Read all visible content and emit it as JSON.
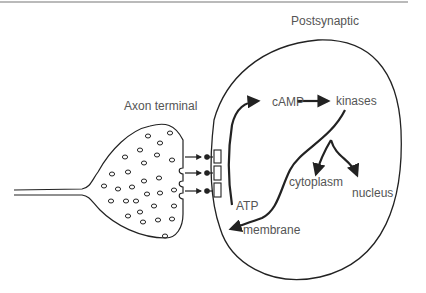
{
  "figure": {
    "top_rule": true,
    "colors": {
      "stroke": "#222222",
      "text": "#555555",
      "background": "#ffffff"
    },
    "labels": {
      "postsynaptic": "Postsynaptic",
      "axon_terminal": "Axon terminal",
      "camp": "cAMP",
      "kinases": "kinases",
      "cytoplasm": "cytoplasm",
      "nucleus": "nucleus",
      "atp": "ATP",
      "membrane": "membrane"
    },
    "pathway": [
      {
        "from": "ATP",
        "to": "cAMP"
      },
      {
        "from": "cAMP",
        "to": "kinases"
      },
      {
        "from": "kinases",
        "to": "cytoplasm"
      },
      {
        "from": "kinases",
        "to": "nucleus"
      },
      {
        "from": "kinases",
        "to": "membrane"
      }
    ],
    "receptor_count": 3,
    "release_sites": 3
  }
}
